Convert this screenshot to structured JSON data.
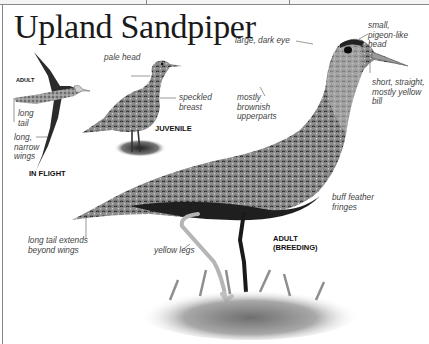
{
  "page": {
    "title": "Upland Sandpiper"
  },
  "figures": {
    "in_flight": {
      "caption": "IN FLIGHT",
      "sublabel": "ADULT",
      "labels": [
        "long tail",
        "long, narrow wings"
      ]
    },
    "juvenile": {
      "caption": "JUVENILE",
      "labels": [
        "pale head",
        "speckled breast"
      ]
    },
    "adult_breeding": {
      "caption_line1": "ADULT",
      "caption_line2": "(BREEDING)",
      "labels": {
        "eye": "large, dark eye",
        "head": "small, pigeon-like head",
        "bill": "short, straight, mostly yellow bill",
        "upperparts": "mostly brownish upperparts",
        "fringes": "buff feather fringes",
        "legs": "yellow legs",
        "tail": "long tail extends beyond wings"
      }
    }
  },
  "colors": {
    "text": "#1a1a1a",
    "label": "#444444",
    "bird_dark": "#2a2a2a",
    "bird_mid": "#7a7a7a",
    "bird_light": "#c8c8c8",
    "rule": "#888888"
  }
}
